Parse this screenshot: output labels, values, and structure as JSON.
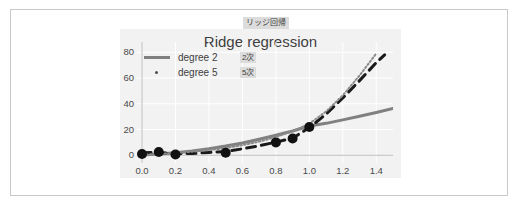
{
  "caption": {
    "text": "リッジ回帰"
  },
  "chart_data": {
    "type": "line",
    "title": "Ridge regression",
    "xlabel": "",
    "ylabel": "",
    "xlim": [
      -0.03,
      1.5
    ],
    "ylim": [
      -6,
      88
    ],
    "xticks": [
      "0.0",
      "0.2",
      "0.4",
      "0.6",
      "0.8",
      "1.0",
      "1.2",
      "1.4"
    ],
    "xtick_values": [
      0.0,
      0.2,
      0.4,
      0.6,
      0.8,
      1.0,
      1.2,
      1.4
    ],
    "yticks": [
      "0",
      "20",
      "40",
      "60",
      "80"
    ],
    "ytick_values": [
      0,
      20,
      40,
      60,
      80
    ],
    "grid": true,
    "legend_position": "upper left",
    "legend": [
      {
        "label": "degree 2",
        "note": "2次",
        "marker": "line",
        "color": "#808080"
      },
      {
        "label": "degree 5",
        "note": "5次",
        "marker": "dot",
        "color": "#4d4d4d"
      }
    ],
    "series": [
      {
        "name": "degree 2",
        "style": "solid",
        "color": "#808080",
        "width": 3,
        "x": [
          0.0,
          0.1,
          0.2,
          0.3,
          0.4,
          0.5,
          0.6,
          0.7,
          0.8,
          0.9,
          1.0,
          1.1,
          1.2,
          1.3,
          1.4,
          1.5
        ],
        "y": [
          0.3,
          1.0,
          2.0,
          3.4,
          5.1,
          7.2,
          9.6,
          12.4,
          15.5,
          18.9,
          22.7,
          24.8,
          27.5,
          30.3,
          33.2,
          36.3
        ]
      },
      {
        "name": "degree 5",
        "style": "dashed",
        "color": "#1a1a1a",
        "width": 3,
        "x": [
          0.0,
          0.1,
          0.2,
          0.3,
          0.4,
          0.5,
          0.6,
          0.7,
          0.8,
          0.9,
          1.0,
          1.1,
          1.2,
          1.3,
          1.4,
          1.45
        ],
        "y": [
          2.0,
          2.2,
          1.3,
          1.4,
          2.2,
          2.9,
          5.0,
          7.4,
          10.2,
          13.3,
          21.5,
          32.0,
          44.5,
          58.0,
          72.0,
          78.0
        ]
      },
      {
        "name": "ridge fit",
        "style": "dotted",
        "color": "#8a8a8a",
        "width": 2,
        "x": [
          0.0,
          0.1,
          0.2,
          0.3,
          0.4,
          0.5,
          0.6,
          0.7,
          0.8,
          0.9,
          1.0,
          1.1,
          1.2,
          1.3,
          1.4
        ],
        "y": [
          0.4,
          1.0,
          1.8,
          2.8,
          4.0,
          5.6,
          7.8,
          10.6,
          14.2,
          18.6,
          24.6,
          34.0,
          46.5,
          62.0,
          79.0
        ]
      }
    ],
    "scatter": {
      "name": "samples",
      "color": "#111111",
      "size": 5,
      "points": [
        {
          "x": 0.0,
          "y": 1.0
        },
        {
          "x": 0.1,
          "y": 2.5
        },
        {
          "x": 0.2,
          "y": 0.6
        },
        {
          "x": 0.5,
          "y": 2.0
        },
        {
          "x": 0.8,
          "y": 10.0
        },
        {
          "x": 0.9,
          "y": 13.0
        },
        {
          "x": 1.0,
          "y": 22.0
        }
      ]
    }
  }
}
